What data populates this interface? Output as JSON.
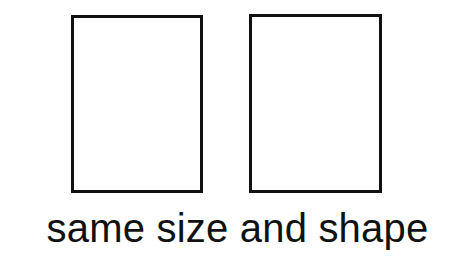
{
  "figure": {
    "background_color": "#ffffff",
    "stroke_color": "#111111",
    "text_color": "#111111",
    "caption": "same size and shape",
    "shapes": [
      {
        "name": "rectangle-left",
        "kind": "rectangle",
        "fill": "#ffffff",
        "stroke": "#111111",
        "stroke_width_px": 3,
        "x": 71,
        "y": 15,
        "width": 132,
        "height": 178
      },
      {
        "name": "rectangle-right",
        "kind": "rectangle",
        "fill": "#ffffff",
        "stroke": "#111111",
        "stroke_width_px": 3,
        "x": 249,
        "y": 14,
        "width": 133,
        "height": 179
      }
    ]
  }
}
